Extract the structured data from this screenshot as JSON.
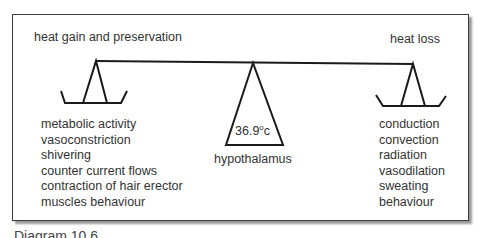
{
  "diagram": {
    "title_left": "heat gain and preservation",
    "title_right": "heat loss",
    "fulcrum": {
      "temperature": "36.9",
      "degree": "o",
      "unit": "c",
      "label": "hypothalamus"
    },
    "heat_gain_items": [
      "metabolic activity",
      "vasoconstriction",
      "shivering",
      "counter current flows",
      "contraction of hair erector",
      "muscles behaviour"
    ],
    "heat_loss_items": [
      "conduction",
      "convection",
      "radiation",
      "vasodilation",
      "sweating",
      "behaviour"
    ],
    "caption": "Diagram 10.6",
    "colors": {
      "line": "#1a1a1a",
      "text": "#333333",
      "frame_shadow": "#9a9a9a"
    }
  }
}
